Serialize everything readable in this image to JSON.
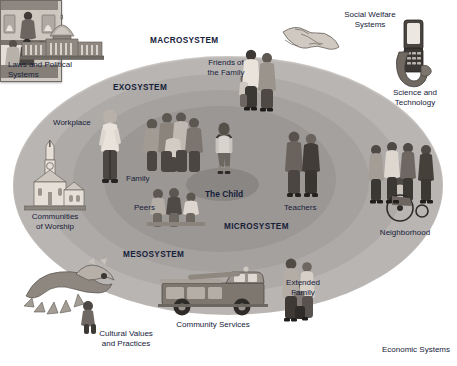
{
  "diagram": {
    "type": "concentric-ellipse-diagram",
    "palette": {
      "background": "#ffffff",
      "text": "#16213a",
      "macrosystem_fill": "#b9b5b2",
      "exosystem_fill": "#aeaaa7",
      "mesosystem_fill": "#a5a19e",
      "microsystem_fill": "#9b9794",
      "child_fill": "#8a8683"
    }
  },
  "systems": [
    {
      "key": "macrosystem",
      "label": "MACROSYSTEM"
    },
    {
      "key": "exosystem",
      "label": "EXOSYSTEM"
    },
    {
      "key": "mesosystem",
      "label": "MESOSYSTEM"
    },
    {
      "key": "microsystem",
      "label": "MICROSYSTEM"
    }
  ],
  "center": {
    "label": "The Child"
  },
  "inner_items": [
    {
      "key": "family",
      "label": "Family"
    },
    {
      "key": "peers",
      "label": "Peers"
    },
    {
      "key": "teachers",
      "label": "Teachers"
    },
    {
      "key": "friends_of_the_family",
      "label": "Friends of\nthe Family"
    },
    {
      "key": "extended_family",
      "label": "Extended\nFamily"
    },
    {
      "key": "workplace",
      "label": "Workplace"
    }
  ],
  "inner_labels": {
    "family": "Family",
    "peers": "Peers",
    "teachers": "Teachers",
    "friends_of_the_family_line1": "Friends of",
    "friends_of_the_family_line2": "the Family",
    "extended_family_line1": "Extended",
    "extended_family_line2": "Family",
    "workplace": "Workplace"
  },
  "outer_labels": {
    "laws_and_political_systems_line1": "Laws and Political",
    "laws_and_political_systems_line2": "Systems",
    "communities_of_worship_line1": "Communities",
    "communities_of_worship_line2": "of Worship",
    "cultural_values_line1": "Cultural Values",
    "cultural_values_line2": "and Practices",
    "community_services": "Community Services",
    "social_welfare_line1": "Social Welfare",
    "social_welfare_line2": "Systems",
    "science_and_technology_line1": "Science and",
    "science_and_technology_line2": "Technology",
    "neighborhood": "Neighborhood",
    "economic_systems": "Economic Systems"
  },
  "illustrations": [
    {
      "key": "capitol-building",
      "caption": "Laws and Political Systems"
    },
    {
      "key": "church-building",
      "caption": "Communities of Worship"
    },
    {
      "key": "dragon-dancer",
      "caption": "Cultural Values and Practices"
    },
    {
      "key": "fire-truck",
      "caption": "Community Services"
    },
    {
      "key": "handshake",
      "caption": "Social Welfare Systems"
    },
    {
      "key": "mobile-phone-hand",
      "caption": "Science and Technology"
    },
    {
      "key": "neighborhood-people",
      "caption": "Neighborhood"
    },
    {
      "key": "shop-interior-photo",
      "caption": "Economic Systems"
    }
  ]
}
